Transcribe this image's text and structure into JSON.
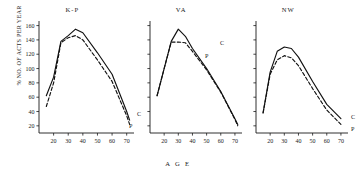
{
  "figure": {
    "ylabel": "% NO. OF ACTS PER YEAR",
    "xlabel": "A G E"
  },
  "chart_data": {
    "type": "line",
    "title": "",
    "xlabel": "A G E",
    "ylabel": "% NO. OF ACTS PER YEAR",
    "xlim": [
      10,
      75
    ],
    "ylim": [
      10,
      165
    ],
    "xticks": [
      20,
      30,
      40,
      50,
      60,
      70
    ],
    "yticks": [
      20,
      40,
      60,
      80,
      100,
      120,
      140,
      160
    ],
    "grid": false,
    "legend_position": "inline-endpoint-labels",
    "panels": [
      {
        "name": "K-P",
        "title": "K-P",
        "series": [
          {
            "name": "C",
            "label": "C",
            "style": "solid",
            "x": [
              15,
              20,
              25,
              30,
              35,
              40,
              50,
              60,
              70,
              72
            ],
            "values": [
              62,
              88,
              138,
              146,
              155,
              150,
              122,
              92,
              40,
              28
            ]
          },
          {
            "name": "P",
            "label": "P",
            "style": "dashed",
            "x": [
              15,
              20,
              25,
              30,
              35,
              40,
              50,
              60,
              70,
              72
            ],
            "values": [
              47,
              80,
              136,
              143,
              146,
              140,
              112,
              82,
              34,
              22
            ]
          }
        ]
      },
      {
        "name": "VA",
        "title": "VA",
        "series": [
          {
            "name": "C",
            "label": "C",
            "style": "solid",
            "x": [
              15,
              20,
              25,
              30,
              35,
              40,
              50,
              60,
              70,
              72
            ],
            "values": [
              62,
              100,
              138,
              155,
              145,
              128,
              100,
              68,
              30,
              22
            ]
          },
          {
            "name": "P",
            "label": "P",
            "style": "dashed",
            "x": [
              15,
              20,
              25,
              30,
              35,
              40,
              50,
              60,
              70,
              72
            ],
            "values": [
              62,
              100,
              137,
              137,
              136,
              124,
              98,
              67,
              29,
              20
            ]
          }
        ]
      },
      {
        "name": "NW",
        "title": "NW",
        "series": [
          {
            "name": "C",
            "label": "C",
            "style": "solid",
            "x": [
              15,
              20,
              25,
              30,
              35,
              40,
              50,
              60,
              70
            ],
            "values": [
              38,
              95,
              124,
              130,
              128,
              116,
              82,
              50,
              30
            ]
          },
          {
            "name": "P",
            "label": "P",
            "style": "dashed",
            "x": [
              15,
              20,
              25,
              30,
              35,
              40,
              50,
              60,
              70
            ],
            "values": [
              38,
              92,
              112,
              118,
              115,
              104,
              72,
              42,
              22
            ]
          }
        ]
      }
    ]
  }
}
